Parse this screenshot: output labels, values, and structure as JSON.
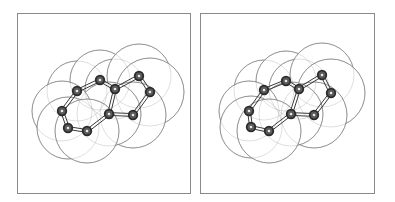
{
  "figure": {
    "type": "stereo-pair",
    "colors": {
      "frame": "#8a8a8a",
      "sphere_outline": "#6e6e6e",
      "atom": "#2b2b2b",
      "bond": "#3a3a3a",
      "background": "#ffffff"
    }
  },
  "panels": [
    {
      "id": "left",
      "frame": {
        "x": 17,
        "y": 13,
        "w": 174,
        "h": 181
      },
      "atoms": [
        [
          76,
          90
        ],
        [
          99,
          79
        ],
        [
          114,
          88
        ],
        [
          138,
          75
        ],
        [
          149,
          91
        ],
        [
          132,
          114
        ],
        [
          108,
          113
        ],
        [
          61,
          110
        ],
        [
          67,
          127
        ],
        [
          86,
          130
        ]
      ],
      "spheres": [
        [
          76,
          90,
          30
        ],
        [
          99,
          79,
          30
        ],
        [
          114,
          88,
          30
        ],
        [
          138,
          75,
          32
        ],
        [
          149,
          91,
          34
        ],
        [
          132,
          114,
          33
        ],
        [
          108,
          113,
          32
        ],
        [
          61,
          110,
          30
        ],
        [
          67,
          127,
          31
        ],
        [
          86,
          130,
          32
        ]
      ]
    },
    {
      "id": "right",
      "frame": {
        "x": 200,
        "y": 13,
        "w": 175,
        "h": 181
      },
      "atoms": [
        [
          263,
          89
        ],
        [
          285,
          80
        ],
        [
          298,
          88
        ],
        [
          321,
          74
        ],
        [
          330,
          92
        ],
        [
          313,
          114
        ],
        [
          290,
          113
        ],
        [
          248,
          110
        ],
        [
          250,
          126
        ],
        [
          268,
          130
        ]
      ],
      "spheres": [
        [
          263,
          89,
          30
        ],
        [
          285,
          80,
          30
        ],
        [
          298,
          88,
          30
        ],
        [
          321,
          74,
          32
        ],
        [
          330,
          92,
          34
        ],
        [
          313,
          114,
          33
        ],
        [
          290,
          113,
          32
        ],
        [
          248,
          110,
          30
        ],
        [
          250,
          126,
          31
        ],
        [
          268,
          130,
          32
        ]
      ]
    }
  ],
  "bonds": [
    [
      0,
      1,
      2
    ],
    [
      1,
      2,
      2
    ],
    [
      2,
      3,
      2
    ],
    [
      3,
      4,
      2
    ],
    [
      4,
      5,
      2
    ],
    [
      5,
      6,
      2
    ],
    [
      6,
      2,
      2
    ],
    [
      0,
      7,
      2
    ],
    [
      7,
      8,
      2
    ],
    [
      8,
      9,
      2
    ],
    [
      9,
      6,
      2
    ]
  ]
}
